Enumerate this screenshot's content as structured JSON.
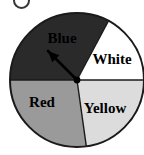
{
  "figure": {
    "title": "",
    "background_color": "#ffffff",
    "width": 144,
    "height": 155,
    "top_artifact": {
      "name": "clipped-glyph-artifact",
      "description": "partial character clipped at top edge"
    }
  },
  "geometry": {
    "center_x": 77,
    "center_y": 80,
    "radius": 67,
    "outline_color": "#1a1a1a",
    "outline_width": 2
  },
  "pointer": {
    "label": "spinner-arrow",
    "from_x": 77,
    "from_y": 80,
    "to_x": 48,
    "to_y": 51,
    "color": "#000000",
    "points_to": "Blue"
  },
  "chart_data": {
    "type": "pie",
    "title": "",
    "xlabel": "",
    "ylabel": "",
    "grid": false,
    "legend": "none",
    "labels_inside_slices": true,
    "categories": [
      "Blue",
      "White",
      "Yellow",
      "Red"
    ],
    "values": [
      118,
      62,
      82,
      98
    ],
    "value_unit": "degrees",
    "percentages": [
      32.8,
      17.2,
      22.8,
      27.2
    ],
    "start_angle_deg": 180,
    "direction": "clockwise",
    "slices": [
      {
        "label": "Blue",
        "color": "#2a2a2a",
        "text_color": "#000000",
        "start_deg": 180,
        "end_deg": 298,
        "sweep_deg": 118,
        "label_x": 62,
        "label_y": 43
      },
      {
        "label": "White",
        "color": "#ffffff",
        "text_color": "#000000",
        "start_deg": 298,
        "end_deg": 360,
        "sweep_deg": 62,
        "label_x": 112,
        "label_y": 64
      },
      {
        "label": "Yellow",
        "color": "#dcdcdc",
        "text_color": "#000000",
        "start_deg": 0,
        "end_deg": 82,
        "sweep_deg": 82,
        "label_x": 105,
        "label_y": 113
      },
      {
        "label": "Red",
        "color": "#9a9a9a",
        "text_color": "#000000",
        "start_deg": 82,
        "end_deg": 180,
        "sweep_deg": 98,
        "label_x": 42,
        "label_y": 107
      }
    ]
  }
}
